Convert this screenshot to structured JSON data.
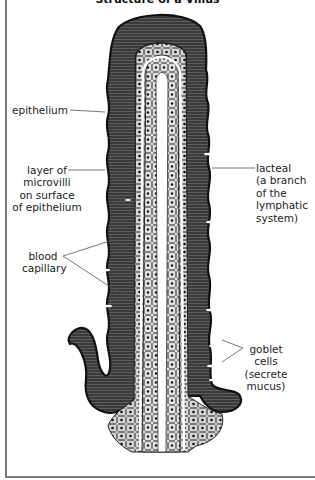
{
  "figure": {
    "title": "Structure of a Villus",
    "labels": {
      "epithelium": "epithelium",
      "microvilli": [
        "layer of",
        "microvilli",
        "on surface",
        "of epithelium"
      ],
      "blood_capillary": [
        "blood",
        "capillary"
      ],
      "lacteal": [
        "lacteal",
        "(a branch",
        "of the",
        "lymphatic",
        "system)"
      ],
      "goblet_cells": [
        "goblet",
        "cells",
        "(secrete",
        "mucus)"
      ]
    },
    "colors": {
      "epithelium_dark": "#2a2a2a",
      "microvilli_stripe": "#6b6b6b",
      "cell_fill": "#d9d9d9",
      "nucleus": "#1a1a1a",
      "lacteal_channel": "#ffffff",
      "leader_line": "#555555"
    }
  }
}
